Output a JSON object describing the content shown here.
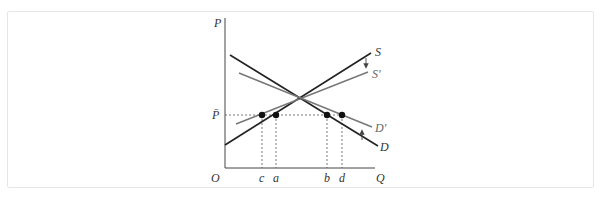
{
  "caption": "",
  "diagram": {
    "axes": {
      "y_label": "P",
      "x_label": "Q",
      "origin_label": "O",
      "price_level_label": "P̄"
    },
    "curves": {
      "S": {
        "label": "S",
        "color": "#222222"
      },
      "S_prime": {
        "label": "S'",
        "color": "#777777"
      },
      "D": {
        "label": "D",
        "color": "#222222"
      },
      "D_prime": {
        "label": "D'",
        "color": "#777777"
      }
    },
    "quantity_labels": [
      "c",
      "a",
      "b",
      "d"
    ],
    "arrows": [
      {
        "name": "supply-shift-arrow",
        "direction": "down"
      },
      {
        "name": "demand-shift-arrow",
        "direction": "up"
      }
    ]
  }
}
